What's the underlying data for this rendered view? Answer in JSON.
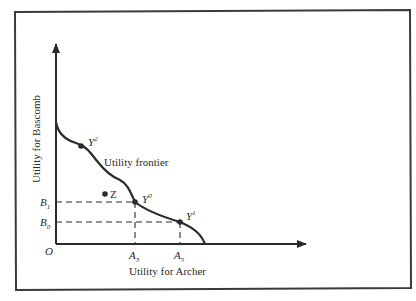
{
  "diagram": {
    "axes": {
      "y_label": "Utility for Bascomb",
      "x_label": "Utility for Archer",
      "origin_label": "O"
    },
    "curve_label": "Utility frontier",
    "points": [
      {
        "id": "Y2",
        "base": "Y",
        "sup": "2"
      },
      {
        "id": "Y0",
        "base": "Y",
        "sup": "0"
      },
      {
        "id": "Y1",
        "base": "Y",
        "sup": "1"
      },
      {
        "id": "Z",
        "label": "Z"
      }
    ],
    "y_ticks": [
      {
        "base": "B",
        "sub": "1"
      },
      {
        "base": "B",
        "sub": "0"
      }
    ],
    "x_ticks": [
      {
        "base": "A",
        "sub": "3"
      },
      {
        "base": "A",
        "sub": "5"
      }
    ],
    "colors": {
      "ink": "#2a2a2a",
      "frame": "#3a3a3a",
      "background": "#ffffff"
    }
  }
}
